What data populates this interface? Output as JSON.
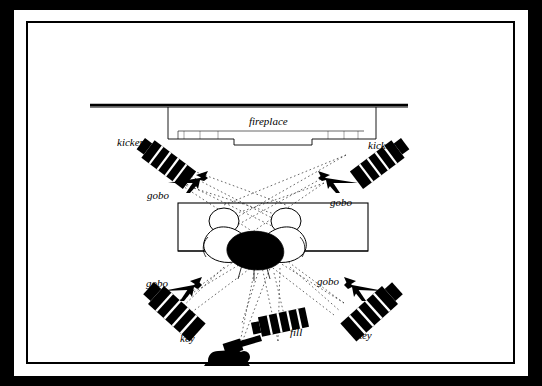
{
  "diagram": {
    "background_color": "#000000",
    "paper_color": "#ffffff",
    "ink_color": "#000000",
    "labels": {
      "fireplace": "fireplace",
      "kicker_left": "kicker",
      "kicker_right": "kicker",
      "gobo_upper_left": "gobo",
      "gobo_upper_right": "gobo",
      "gobo_lower_left": "gobo",
      "gobo_lower_right": "gobo",
      "key_left": "key",
      "key_right": "key",
      "fill": "fill"
    },
    "elements": [
      {
        "name": "fireplace-wall",
        "type": "wall"
      },
      {
        "name": "sofa-table-area",
        "type": "furniture-rectangle"
      },
      {
        "name": "two-figures",
        "type": "subjects"
      },
      {
        "name": "light-beam-lines",
        "type": "dotted-rays"
      },
      {
        "name": "camera",
        "type": "camera-icon"
      }
    ]
  }
}
